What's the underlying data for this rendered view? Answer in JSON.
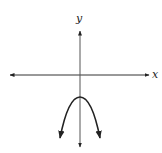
{
  "figure": {
    "axes": {
      "x_label": "x",
      "y_label": "y",
      "color": "#222222"
    },
    "curve": {
      "type": "parabola",
      "opens": "down",
      "vertex_position": "below origin on y-axis",
      "color": "#222222"
    }
  }
}
